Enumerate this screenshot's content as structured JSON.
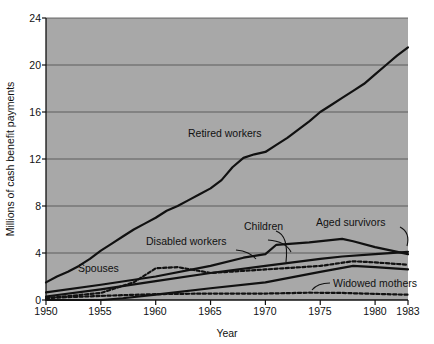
{
  "chart_data": {
    "type": "line",
    "title": "",
    "xlabel": "Year",
    "ylabel": "Millions of cash benefit payments",
    "xlim": [
      1950,
      1983
    ],
    "ylim": [
      0,
      24
    ],
    "xticks": [
      1950,
      1955,
      1960,
      1965,
      1970,
      1975,
      1980,
      1983
    ],
    "yticks": [
      0,
      4,
      8,
      12,
      16,
      20,
      24
    ],
    "grid": "horizontal",
    "legend": "inline-annotations",
    "plot_background": "#a8a8a8",
    "line_color": "#111111",
    "series": [
      {
        "name": "Retired workers",
        "style": "solid",
        "x": [
          1950,
          1951,
          1952,
          1953,
          1954,
          1955,
          1956,
          1957,
          1958,
          1959,
          1960,
          1961,
          1962,
          1963,
          1964,
          1965,
          1966,
          1967,
          1968,
          1969,
          1970,
          1971,
          1972,
          1973,
          1974,
          1975,
          1976,
          1977,
          1978,
          1979,
          1980,
          1981,
          1982,
          1983
        ],
        "values": [
          1.5,
          2.0,
          2.4,
          2.9,
          3.5,
          4.2,
          4.8,
          5.4,
          6.0,
          6.5,
          7.0,
          7.6,
          8.0,
          8.5,
          9.0,
          9.5,
          10.2,
          11.3,
          12.1,
          12.4,
          12.6,
          13.2,
          13.8,
          14.5,
          15.2,
          16.0,
          16.6,
          17.2,
          17.8,
          18.4,
          19.2,
          20.0,
          20.8,
          21.5
        ]
      },
      {
        "name": "Aged survivors",
        "style": "solid",
        "x": [
          1950,
          1955,
          1960,
          1965,
          1970,
          1975,
          1977,
          1980,
          1983
        ],
        "values": [
          0.3,
          0.9,
          1.6,
          2.3,
          2.9,
          3.5,
          3.7,
          3.9,
          4.1
        ]
      },
      {
        "name": "Children",
        "style": "solid",
        "x": [
          1950,
          1955,
          1960,
          1965,
          1968,
          1970,
          1971,
          1974,
          1977,
          1978,
          1980,
          1983
        ],
        "values": [
          0.65,
          1.3,
          2.0,
          2.9,
          3.6,
          3.9,
          4.7,
          4.9,
          5.2,
          5.0,
          4.5,
          3.9
        ]
      },
      {
        "name": "Spouses",
        "style": "dashed",
        "x": [
          1950,
          1955,
          1958,
          1960,
          1962,
          1965,
          1970,
          1975,
          1978,
          1980,
          1983
        ],
        "values": [
          0.15,
          0.6,
          1.5,
          2.7,
          2.8,
          2.3,
          2.6,
          2.9,
          3.3,
          3.2,
          3.0
        ]
      },
      {
        "name": "Disabled workers",
        "style": "solid",
        "x": [
          1950,
          1955,
          1957,
          1960,
          1965,
          1970,
          1975,
          1978,
          1980,
          1983
        ],
        "values": [
          0.0,
          0.0,
          0.15,
          0.45,
          1.0,
          1.5,
          2.4,
          2.9,
          2.8,
          2.6
        ]
      },
      {
        "name": "Widowed mothers",
        "style": "dashed",
        "x": [
          1950,
          1955,
          1960,
          1965,
          1970,
          1974,
          1977,
          1980,
          1983
        ],
        "values": [
          0.17,
          0.35,
          0.5,
          0.55,
          0.55,
          0.62,
          0.6,
          0.52,
          0.45
        ]
      }
    ],
    "annotations": [
      {
        "name": "Retired workers",
        "text": "Retired workers"
      },
      {
        "name": "Aged survivors",
        "text": "Aged survivors"
      },
      {
        "name": "Children",
        "text": "Children"
      },
      {
        "name": "Spouses",
        "text": "Spouses"
      },
      {
        "name": "Disabled workers",
        "text": "Disabled workers"
      },
      {
        "name": "Widowed mothers",
        "text": "Widowed mothers"
      }
    ]
  },
  "axes": {
    "y_title": "Millions of cash benefit payments",
    "x_title": "Year",
    "y_tick_0": "0",
    "y_tick_4": "4",
    "y_tick_8": "8",
    "y_tick_12": "12",
    "y_tick_16": "16",
    "y_tick_20": "20",
    "y_tick_24": "24",
    "x_tick_1950": "1950",
    "x_tick_1955": "1955",
    "x_tick_1960": "1960",
    "x_tick_1965": "1965",
    "x_tick_1970": "1970",
    "x_tick_1975": "1975",
    "x_tick_1980": "1980",
    "x_tick_1983": "1983"
  },
  "labels": {
    "retired_workers": "Retired workers",
    "aged_survivors": "Aged survivors",
    "children": "Children",
    "spouses": "Spouses",
    "disabled_workers": "Disabled workers",
    "widowed_mothers": "Widowed mothers"
  }
}
